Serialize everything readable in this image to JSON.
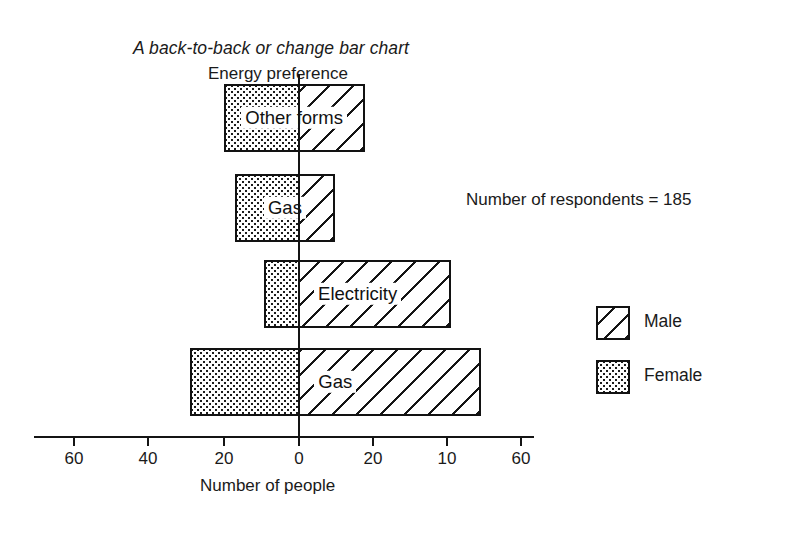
{
  "chart_data": {
    "type": "bar",
    "subtype": "back-to-back horizontal bar (population pyramid style)",
    "title": "A back-to-back or change bar chart",
    "ylabel": "Energy preference",
    "xlabel": "Number of people",
    "annotation": "Number of respondents  =  185",
    "categories": [
      "Other forms",
      "Gas",
      "Electricity",
      "Gas"
    ],
    "series": [
      {
        "name": "Female",
        "direction": "left",
        "values": [
          20,
          17,
          9,
          29
        ]
      },
      {
        "name": "Male",
        "direction": "right",
        "values": [
          18,
          10,
          41,
          49
        ]
      }
    ],
    "axis": {
      "tick_labels": [
        "60",
        "40",
        "20",
        "0",
        "20",
        "10",
        "60"
      ],
      "tick_values": [
        -60,
        -40,
        -20,
        0,
        20,
        10,
        60
      ],
      "xlim": [
        -63,
        63
      ],
      "grid": false,
      "zero_line": true
    },
    "legend": {
      "position": "right",
      "entries": [
        {
          "label": "Male",
          "pattern": "diagonal-hatch"
        },
        {
          "label": "Female",
          "pattern": "dotted-stipple"
        }
      ]
    },
    "colors": {
      "ink": "#141414",
      "background": "#ffffff"
    }
  },
  "bars": [
    {
      "label": "Other forms",
      "female": 20,
      "male": 18
    },
    {
      "label": "Gas",
      "female": 17,
      "male": 10
    },
    {
      "label": "Electricity",
      "female": 9,
      "male": 41
    },
    {
      "label": "Gas",
      "female": 29,
      "male": 49
    }
  ],
  "ticks": [
    {
      "label": "60",
      "x": 73
    },
    {
      "label": "40",
      "x": 147
    },
    {
      "label": "20",
      "x": 223
    },
    {
      "label": "0",
      "x": 298
    },
    {
      "label": "20",
      "x": 372
    },
    {
      "label": "10",
      "x": 446
    },
    {
      "label": "60",
      "x": 520
    }
  ],
  "legend_items": [
    {
      "label": "Male"
    },
    {
      "label": "Female"
    }
  ]
}
